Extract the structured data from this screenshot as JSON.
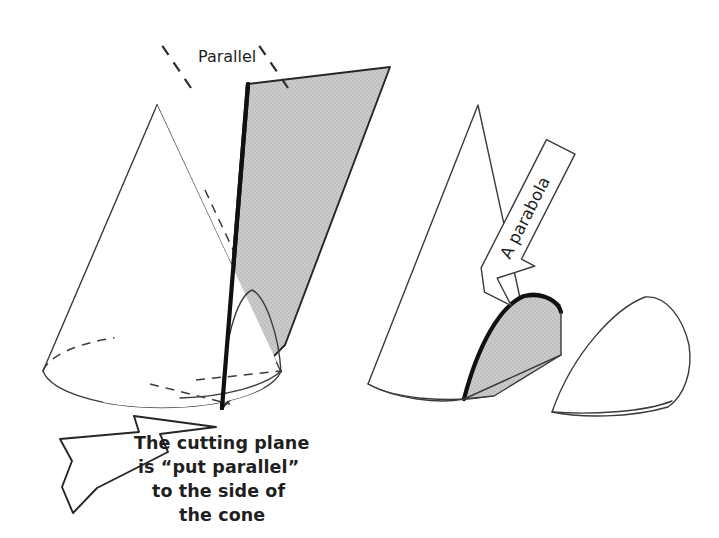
{
  "figure": {
    "title_alt": "Conic section: plane parallel to the side of a cone produces a parabola",
    "background_color": "#ffffff",
    "ink_color": "#262626",
    "shade_color": "#c9c9c9",
    "shade_color_dark": "#bdbdbd"
  },
  "labels": {
    "parallel": "Parallel",
    "parabola": "A parabola"
  },
  "caption": {
    "lines": [
      "The cutting plane",
      "is “put parallel”",
      "to the side of",
      "the cone"
    ],
    "line1": "The cutting plane",
    "line2": "is “put parallel”",
    "line3": "to the side of",
    "line4": "the cone"
  },
  "panels": {
    "left": {
      "name": "cone-with-cutting-plane",
      "cone_apex": "157,105",
      "base_center": "162,375",
      "shaded_plane": "grey parallelogram cutting the cone parallel to its side"
    },
    "right": {
      "name": "cut-cone-result",
      "cone_apex": "478,105",
      "parabolic_face": "grey parabolic cross-section",
      "detached_piece": "wedge removed from the cone"
    }
  }
}
